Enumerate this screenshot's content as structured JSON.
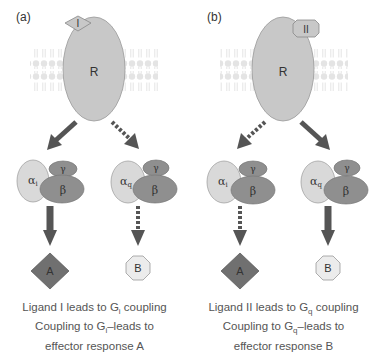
{
  "panels": [
    {
      "tag": "(a)",
      "ligand": "I",
      "receptor": "R",
      "left_g": {
        "alpha": "α",
        "alpha_sub": "i",
        "gamma": "γ",
        "beta": "β"
      },
      "right_g": {
        "alpha": "α",
        "alpha_sub": "q",
        "gamma": "γ",
        "beta": "β"
      },
      "left_effector": "A",
      "right_effector": "B",
      "caption": {
        "line1_pre": "Ligand I leads to G",
        "line1_sub": "i",
        "line1_post": " coupling",
        "line2_pre": "Coupling to G",
        "line2_sub": "i",
        "line2_post": "–leads to",
        "line3": "effector response A"
      }
    },
    {
      "tag": "(b)",
      "ligand": "II",
      "receptor": "R",
      "left_g": {
        "alpha": "α",
        "alpha_sub": "i",
        "gamma": "γ",
        "beta": "β"
      },
      "right_g": {
        "alpha": "α",
        "alpha_sub": "q",
        "gamma": "γ",
        "beta": "β"
      },
      "left_effector": "A",
      "right_effector": "B",
      "caption": {
        "line1_pre": "Ligand II leads to G",
        "line1_sub": "q",
        "line1_post": " coupling",
        "line2_pre": "Coupling to G",
        "line2_sub": "q",
        "line2_post": "–leads to",
        "line3": "effector response B"
      }
    }
  ],
  "colors": {
    "receptor": "#c8c8c8",
    "alpha": "#d9d9d9",
    "beta_gamma": "#8f8f8f",
    "arrow": "#555555",
    "effector_A": "#707070",
    "effector_B": "#ececec",
    "membrane": "#e6e6e6"
  }
}
